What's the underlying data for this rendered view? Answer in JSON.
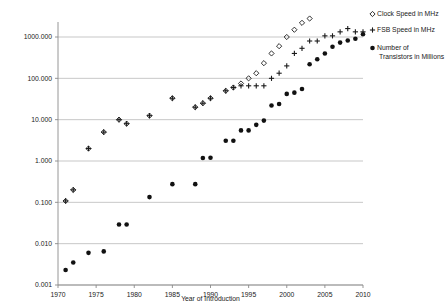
{
  "chart_data": {
    "type": "scatter",
    "title": "",
    "xlabel": "Year of Introduction",
    "ylabel": "",
    "xlim": [
      1969,
      2011
    ],
    "ylim": [
      0.001,
      3000
    ],
    "yscale": "log",
    "grid": "horizontal",
    "legend_position": "right",
    "xticks": [
      "1970",
      "1975",
      "1980",
      "1985",
      "1990",
      "1995",
      "2000",
      "2005",
      "2010"
    ],
    "xtick_values": [
      1970,
      1975,
      1980,
      1985,
      1990,
      1995,
      2000,
      2005,
      2010
    ],
    "yticks": [
      "0.001",
      "0.010",
      "0.100",
      "1.000",
      "10.000",
      "100.000",
      "1000.000"
    ],
    "ytick_values": [
      0.001,
      0.01,
      0.1,
      1,
      10,
      100,
      1000
    ],
    "series": [
      {
        "name": "Clock Speed in MHz",
        "marker": "open-diamond",
        "color": "#1a1a1a",
        "points": [
          [
            1971,
            0.108
          ],
          [
            1972,
            0.2
          ],
          [
            1974,
            2.0
          ],
          [
            1976,
            5.0
          ],
          [
            1978,
            10.0
          ],
          [
            1979,
            8.0
          ],
          [
            1982,
            12.5
          ],
          [
            1985,
            33.0
          ],
          [
            1988,
            20.0
          ],
          [
            1989,
            25.0
          ],
          [
            1990,
            33.0
          ],
          [
            1992,
            50.0
          ],
          [
            1993,
            60.0
          ],
          [
            1994,
            75.0
          ],
          [
            1995,
            100.0
          ],
          [
            1996,
            133.0
          ],
          [
            1997,
            233.0
          ],
          [
            1998,
            400.0
          ],
          [
            1999,
            600.0
          ],
          [
            2000,
            1000.0
          ],
          [
            2001,
            1500.0
          ],
          [
            2002,
            2200.0
          ],
          [
            2003,
            2800.0
          ],
          [
            2004,
            3200.0
          ],
          [
            2005,
            3200.0
          ],
          [
            2006,
            2930.0
          ],
          [
            2007,
            3000.0
          ],
          [
            2008,
            3200.0
          ],
          [
            2009,
            3330.0
          ],
          [
            2010,
            3460.0
          ]
        ]
      },
      {
        "name": "FSB Speed in MHz",
        "marker": "plus",
        "color": "#1a1a1a",
        "points": [
          [
            1971,
            0.108
          ],
          [
            1972,
            0.2
          ],
          [
            1974,
            2.0
          ],
          [
            1976,
            5.0
          ],
          [
            1978,
            10.0
          ],
          [
            1979,
            8.0
          ],
          [
            1982,
            12.5
          ],
          [
            1985,
            33.0
          ],
          [
            1988,
            20.0
          ],
          [
            1989,
            25.0
          ],
          [
            1990,
            33.0
          ],
          [
            1992,
            50.0
          ],
          [
            1993,
            60.0
          ],
          [
            1994,
            66.0
          ],
          [
            1995,
            66.0
          ],
          [
            1996,
            66.0
          ],
          [
            1997,
            66.0
          ],
          [
            1998,
            100.0
          ],
          [
            1999,
            133.0
          ],
          [
            2000,
            200.0
          ],
          [
            2001,
            400.0
          ],
          [
            2002,
            533.0
          ],
          [
            2003,
            800.0
          ],
          [
            2004,
            800.0
          ],
          [
            2005,
            1066.0
          ],
          [
            2006,
            1066.0
          ],
          [
            2007,
            1333.0
          ],
          [
            2008,
            1600.0
          ],
          [
            2009,
            1333.0
          ],
          [
            2010,
            1333.0
          ]
        ]
      },
      {
        "name": "Number of Transistors in Millions",
        "marker": "filled-circle",
        "color": "#111111",
        "points": [
          [
            1971,
            0.0023
          ],
          [
            1972,
            0.0035
          ],
          [
            1974,
            0.006
          ],
          [
            1976,
            0.0065
          ],
          [
            1978,
            0.029
          ],
          [
            1979,
            0.029
          ],
          [
            1982,
            0.134
          ],
          [
            1985,
            0.275
          ],
          [
            1988,
            0.275
          ],
          [
            1989,
            1.18
          ],
          [
            1990,
            1.2
          ],
          [
            1992,
            3.1
          ],
          [
            1993,
            3.1
          ],
          [
            1994,
            5.5
          ],
          [
            1995,
            5.5
          ],
          [
            1996,
            7.5
          ],
          [
            1997,
            9.5
          ],
          [
            1998,
            22.0
          ],
          [
            1999,
            24.0
          ],
          [
            2000,
            42.0
          ],
          [
            2001,
            45.0
          ],
          [
            2002,
            55.0
          ],
          [
            2003,
            220.0
          ],
          [
            2004,
            290.0
          ],
          [
            2005,
            400.0
          ],
          [
            2006,
            582.0
          ],
          [
            2007,
            731.0
          ],
          [
            2008,
            820.0
          ],
          [
            2009,
            904.0
          ],
          [
            2010,
            1170.0
          ]
        ]
      }
    ]
  },
  "legend": {
    "items": [
      {
        "label": "Clock Speed in MHz",
        "marker": "open-diamond"
      },
      {
        "label": "FSB Speed in MHz",
        "marker": "plus"
      },
      {
        "label": "Number of",
        "label2": "Transistors in Millions",
        "marker": "filled-circle"
      }
    ]
  }
}
